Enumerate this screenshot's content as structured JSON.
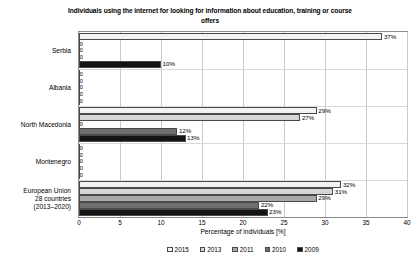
{
  "chart_data": {
    "type": "bar",
    "orientation": "horizontal",
    "title": "Individuals using the internet for looking for information about education, training or course offers",
    "xlabel": "Percentage of individuals [%]",
    "ylabel": "",
    "xlim": [
      0,
      40
    ],
    "xticks": [
      0,
      5,
      10,
      15,
      20,
      25,
      30,
      35,
      40
    ],
    "grid": true,
    "legend_position": "bottom",
    "value_suffix": "%",
    "categories": [
      "Serbia",
      "Albania",
      "North Macedonia",
      "Montenegro",
      "European Union\n28 countries\n(2013–2020)"
    ],
    "category_lines": [
      [
        "Serbia"
      ],
      [
        "Albania"
      ],
      [
        "North Macedonia"
      ],
      [
        "Montenegro"
      ],
      [
        "European Union",
        "28 countries",
        "(2013–2020)"
      ]
    ],
    "series": [
      {
        "name": "2015",
        "color": "#f2f2f2",
        "values": [
          37,
          0,
          29,
          0,
          32
        ],
        "labels": [
          "37%",
          "0",
          "29%",
          "0",
          "32%"
        ]
      },
      {
        "name": "2013",
        "color": "#d6d6d6",
        "values": [
          0,
          0,
          27,
          0,
          31
        ],
        "labels": [
          "0",
          "0",
          "27%",
          "0",
          "31%"
        ]
      },
      {
        "name": "2011",
        "color": "#a8a8a8",
        "values": [
          0,
          0,
          0,
          0,
          29
        ],
        "labels": [
          "0",
          "0",
          "0",
          "0",
          "29%"
        ]
      },
      {
        "name": "2010",
        "color": "#6e6e6e",
        "values": [
          0,
          0,
          12,
          0,
          22
        ],
        "labels": [
          "0",
          "0",
          "12%",
          "0",
          "22%"
        ]
      },
      {
        "name": "2009",
        "color": "#141414",
        "values": [
          10,
          0,
          13,
          0,
          23
        ],
        "labels": [
          "10%",
          "0",
          "13%",
          "0",
          "23%"
        ]
      }
    ]
  }
}
